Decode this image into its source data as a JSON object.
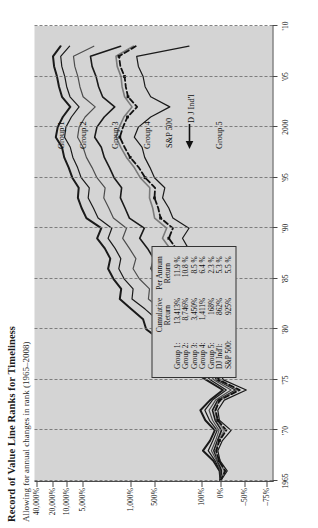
{
  "title": "Record of Value Line Ranks for Timeliness",
  "subtitle": "Allowing for annual changes in rank (1965–2008)",
  "legend": {
    "col_header_1_line1": "Cumulative",
    "col_header_1_line2": "Return",
    "col_header_2_line1": "Per Annum",
    "col_header_2_line2": "Return",
    "rows": [
      {
        "name": "Group 1:",
        "cumulative": "13,413%",
        "per_annum": "11.9 %"
      },
      {
        "name": "Group 2:",
        "cumulative": "8,746%",
        "per_annum": "10.8 %"
      },
      {
        "name": "Group 3:",
        "cumulative": "3,450%",
        "per_annum": "8.5 %"
      },
      {
        "name": "Group 4:",
        "cumulative": "1,411%",
        "per_annum": "6.4 %"
      },
      {
        "name": "Group 5:",
        "cumulative": "168%",
        "per_annum": "2.3 %"
      },
      {
        "name": "DJ Ind'l:",
        "cumulative": "862%",
        "per_annum": "5.3 %"
      },
      {
        "name": "S&P 500:",
        "cumulative": "925%",
        "per_annum": "5.5 %"
      }
    ]
  },
  "annotations": [
    {
      "id": "group-1",
      "text": "Group 1"
    },
    {
      "id": "group-2",
      "text": "Group 2"
    },
    {
      "id": "group-3",
      "text": "Group 3"
    },
    {
      "id": "group-4",
      "text": "Group 4"
    },
    {
      "id": "group-5",
      "text": "Group 5"
    },
    {
      "id": "sp-500",
      "text": "S&P 500"
    },
    {
      "id": "dj-indl",
      "text": "D J Ind'l"
    }
  ],
  "chart_data": {
    "type": "line",
    "title": "Record of Value Line Ranks for Timeliness",
    "subtitle": "Allowing for annual changes in rank (1965–2008)",
    "xlabel": "",
    "ylabel": "",
    "grid": true,
    "legend_position": "inside-lower-left",
    "y_scale": "log-percent",
    "y_ticks": [
      "40,000%",
      "20,000%",
      "10,000%",
      "5,000%",
      "1,000%",
      "500%",
      "100%",
      "0%",
      "–50%",
      "–75%"
    ],
    "y_tick_values": [
      40000,
      20000,
      10000,
      5000,
      1000,
      500,
      100,
      0,
      -50,
      -75
    ],
    "x_ticks": [
      "1965",
      "'70",
      "'75",
      "'80",
      "'85",
      "'90",
      "'95",
      "2000",
      "'05",
      "'10"
    ],
    "x_tick_values": [
      1965,
      1970,
      1975,
      1980,
      1985,
      1990,
      1995,
      2000,
      2005,
      2010
    ],
    "xlim": [
      1965,
      2010
    ],
    "x": [
      1965,
      1966,
      1967,
      1968,
      1969,
      1970,
      1971,
      1972,
      1973,
      1974,
      1975,
      1976,
      1977,
      1978,
      1979,
      1980,
      1981,
      1982,
      1983,
      1984,
      1985,
      1986,
      1987,
      1988,
      1989,
      1990,
      1991,
      1992,
      1993,
      1994,
      1995,
      1996,
      1997,
      1998,
      1999,
      2000,
      2001,
      2002,
      2003,
      2004,
      2005,
      2006,
      2007,
      2008
    ],
    "series": [
      {
        "name": "Group 1",
        "color": "#1a1a1a",
        "style": "solid",
        "width": 2.0,
        "final_cumulative": "13,413%",
        "per_annum": "11.9 %",
        "values": [
          0,
          5,
          38,
          92,
          55,
          30,
          80,
          105,
          55,
          -5,
          75,
          160,
          235,
          320,
          430,
          640,
          700,
          980,
          1450,
          1380,
          1800,
          2150,
          2000,
          2400,
          3100,
          2700,
          4400,
          5200,
          6100,
          5900,
          7800,
          9100,
          11200,
          12500,
          17000,
          15500,
          12000,
          8500,
          12500,
          14500,
          16000,
          18500,
          19500,
          13413
        ]
      },
      {
        "name": "Group 2",
        "color": "#1a1a1a",
        "style": "solid",
        "width": 1.2,
        "final_cumulative": "8,746%",
        "per_annum": "10.8 %",
        "values": [
          0,
          3,
          28,
          65,
          40,
          18,
          58,
          82,
          42,
          -12,
          52,
          115,
          170,
          225,
          300,
          430,
          470,
          660,
          960,
          930,
          1250,
          1500,
          1400,
          1700,
          2150,
          1900,
          3000,
          3500,
          4150,
          4000,
          5300,
          6200,
          7600,
          8500,
          11000,
          10300,
          8100,
          5800,
          8600,
          9900,
          10900,
          12600,
          13300,
          8746
        ]
      },
      {
        "name": "Group 3",
        "color": "#4d4d4d",
        "style": "solid",
        "width": 1.2,
        "final_cumulative": "3,450%",
        "per_annum": "8.5 %",
        "values": [
          0,
          1,
          20,
          48,
          26,
          8,
          42,
          60,
          26,
          -22,
          34,
          78,
          112,
          150,
          198,
          280,
          300,
          420,
          600,
          580,
          780,
          930,
          860,
          1040,
          1310,
          1150,
          1800,
          2100,
          2480,
          2380,
          3120,
          3650,
          4400,
          4900,
          6200,
          5800,
          4600,
          3300,
          4900,
          5600,
          6100,
          7000,
          7400,
          3450
        ]
      },
      {
        "name": "Group 4",
        "color": "#1a1a1a",
        "style": "solid",
        "width": 1.6,
        "final_cumulative": "1,411%",
        "per_annum": "6.4 %",
        "values": [
          0,
          -2,
          14,
          35,
          16,
          -2,
          28,
          42,
          14,
          -32,
          20,
          52,
          74,
          98,
          126,
          176,
          188,
          258,
          364,
          350,
          468,
          556,
          512,
          616,
          772,
          676,
          1040,
          1210,
          1420,
          1360,
          1760,
          2050,
          2440,
          2700,
          3350,
          3120,
          2450,
          1720,
          2580,
          2950,
          3200,
          3650,
          3850,
          1411
        ]
      },
      {
        "name": "S&P 500",
        "color": "#7a7a7a",
        "style": "solid",
        "width": 1.6,
        "final_cumulative": "925%",
        "per_annum": "5.5 %",
        "values": [
          0,
          -8,
          12,
          26,
          10,
          -8,
          18,
          30,
          8,
          -36,
          12,
          38,
          44,
          56,
          70,
          100,
          96,
          130,
          182,
          178,
          244,
          290,
          268,
          318,
          398,
          352,
          498,
          528,
          580,
          575,
          760,
          900,
          1150,
          1400,
          1650,
          1480,
          1260,
          960,
          1230,
          1340,
          1390,
          1580,
          1650,
          925
        ]
      },
      {
        "name": "D J Ind'l",
        "color": "#111111",
        "style": "dashed-markers",
        "width": 1.8,
        "final_cumulative": "862%",
        "per_annum": "5.3 %",
        "values": [
          0,
          -10,
          8,
          22,
          6,
          -12,
          14,
          26,
          4,
          -40,
          8,
          34,
          36,
          44,
          52,
          74,
          68,
          96,
          140,
          136,
          196,
          240,
          218,
          262,
          330,
          290,
          420,
          450,
          500,
          492,
          660,
          790,
          1010,
          1230,
          1450,
          1300,
          1110,
          830,
          1090,
          1180,
          1230,
          1420,
          1490,
          862
        ]
      },
      {
        "name": "Group 5",
        "color": "#1a1a1a",
        "style": "solid",
        "width": 1.2,
        "final_cumulative": "168%",
        "per_annum": "2.3 %",
        "values": [
          0,
          -14,
          2,
          14,
          -4,
          -22,
          6,
          14,
          -8,
          -52,
          -6,
          14,
          18,
          26,
          34,
          56,
          50,
          74,
          110,
          96,
          142,
          168,
          142,
          172,
          212,
          168,
          290,
          330,
          396,
          372,
          500,
          572,
          668,
          720,
          900,
          800,
          560,
          320,
          560,
          660,
          700,
          800,
          840,
          168
        ]
      }
    ]
  }
}
